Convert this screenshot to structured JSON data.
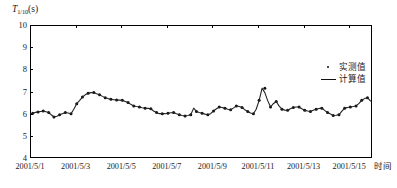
{
  "chart_data": {
    "type": "line",
    "title": "",
    "ylabel": "T1/10(s)",
    "ylabel_base": "T",
    "ylabel_sub": "1/10",
    "ylabel_unit": "(s)",
    "xlabel": "时间",
    "ylim": [
      4,
      10
    ],
    "yticks": [
      4,
      5,
      6,
      7,
      8,
      9,
      10
    ],
    "ytick_labels": [
      "4",
      "5",
      "6",
      "7",
      "8",
      "9",
      "10"
    ],
    "xlim": [
      0,
      15
    ],
    "xticks": [
      0,
      2,
      4,
      6,
      8,
      10,
      12,
      14
    ],
    "xtick_labels": [
      "2001/5/1",
      "2001/5/3",
      "2001/5/5",
      "2001/5/7",
      "2001/5/9",
      "2001/5/11",
      "2001/5/13",
      "2001/5/15"
    ],
    "grid": false,
    "legend_position": "top-right",
    "series": [
      {
        "name": "实测值",
        "marker": "dot",
        "color": "#111111",
        "x": [
          0.12,
          0.35,
          0.58,
          0.82,
          1.05,
          1.3,
          1.55,
          1.8,
          2.05,
          2.3,
          2.55,
          2.8,
          3.05,
          3.3,
          3.55,
          3.8,
          4.05,
          4.3,
          4.55,
          4.8,
          5.05,
          5.3,
          5.55,
          5.8,
          6.05,
          6.3,
          6.55,
          6.8,
          7.05,
          7.3,
          7.55,
          7.8,
          8.05,
          8.3,
          8.55,
          8.8,
          9.05,
          9.3,
          9.55,
          9.8,
          10.05,
          10.3,
          10.55,
          10.8,
          11.05,
          11.3,
          11.55,
          11.8,
          12.05,
          12.3,
          12.55,
          12.8,
          13.05,
          13.3,
          13.55,
          13.8,
          14.05,
          14.3,
          14.55,
          14.8
        ],
        "y": [
          6.02,
          6.08,
          6.12,
          6.05,
          5.85,
          5.95,
          6.05,
          6.0,
          6.45,
          6.75,
          6.92,
          6.95,
          6.85,
          6.72,
          6.65,
          6.62,
          6.6,
          6.5,
          6.35,
          6.3,
          6.25,
          6.22,
          6.05,
          6.0,
          6.02,
          6.05,
          5.95,
          5.9,
          5.95,
          6.1,
          6.02,
          5.95,
          6.12,
          6.3,
          6.25,
          6.18,
          6.35,
          6.28,
          6.1,
          6.0,
          6.6,
          7.15,
          6.3,
          6.55,
          6.2,
          6.15,
          6.28,
          6.3,
          6.15,
          6.1,
          6.2,
          6.25,
          6.05,
          5.92,
          5.95,
          6.25,
          6.3,
          6.35,
          6.6,
          6.72
        ]
      },
      {
        "name": "计算值",
        "marker": "line",
        "color": "#222222",
        "x": [
          0.0,
          0.12,
          0.25,
          0.35,
          0.47,
          0.58,
          0.7,
          0.82,
          0.93,
          1.05,
          1.18,
          1.3,
          1.42,
          1.55,
          1.67,
          1.8,
          1.92,
          2.05,
          2.18,
          2.3,
          2.42,
          2.55,
          2.67,
          2.8,
          2.92,
          3.05,
          3.18,
          3.3,
          3.42,
          3.55,
          3.67,
          3.8,
          3.92,
          4.05,
          4.18,
          4.3,
          4.42,
          4.55,
          4.67,
          4.8,
          4.92,
          5.05,
          5.18,
          5.3,
          5.42,
          5.55,
          5.67,
          5.8,
          5.92,
          6.05,
          6.18,
          6.3,
          6.42,
          6.55,
          6.67,
          6.8,
          6.92,
          7.05,
          7.18,
          7.3,
          7.42,
          7.55,
          7.67,
          7.8,
          7.92,
          8.05,
          8.18,
          8.3,
          8.42,
          8.55,
          8.67,
          8.8,
          8.92,
          9.05,
          9.18,
          9.3,
          9.42,
          9.55,
          9.67,
          9.8,
          9.92,
          10.05,
          10.18,
          10.3,
          10.42,
          10.55,
          10.67,
          10.8,
          10.92,
          11.05,
          11.18,
          11.3,
          11.42,
          11.55,
          11.67,
          11.8,
          11.92,
          12.05,
          12.18,
          12.3,
          12.42,
          12.55,
          12.67,
          12.8,
          12.92,
          13.05,
          13.18,
          13.3,
          13.42,
          13.55,
          13.67,
          13.8,
          13.92,
          14.05,
          14.18,
          14.3,
          14.42,
          14.55,
          14.67,
          14.8,
          14.95
        ],
        "y": [
          5.98,
          6.02,
          6.06,
          6.08,
          6.1,
          6.12,
          6.09,
          6.05,
          5.95,
          5.85,
          5.88,
          5.95,
          6.0,
          6.05,
          6.03,
          6.0,
          6.2,
          6.45,
          6.6,
          6.75,
          6.85,
          6.92,
          6.95,
          6.95,
          6.9,
          6.85,
          6.78,
          6.72,
          6.68,
          6.65,
          6.63,
          6.62,
          6.61,
          6.6,
          6.55,
          6.5,
          6.42,
          6.35,
          6.32,
          6.3,
          6.27,
          6.25,
          6.24,
          6.22,
          6.12,
          6.05,
          6.0,
          6.0,
          6.0,
          6.02,
          6.04,
          6.05,
          6.0,
          5.95,
          5.92,
          5.9,
          5.92,
          5.95,
          6.25,
          6.1,
          6.05,
          6.02,
          5.98,
          5.95,
          6.0,
          6.12,
          6.22,
          6.3,
          6.28,
          6.25,
          6.2,
          6.18,
          6.25,
          6.35,
          6.32,
          6.28,
          6.18,
          6.1,
          6.03,
          6.0,
          6.2,
          6.6,
          7.15,
          6.95,
          6.6,
          6.3,
          6.45,
          6.55,
          6.35,
          6.2,
          6.16,
          6.15,
          6.22,
          6.28,
          6.3,
          6.3,
          6.22,
          6.15,
          6.12,
          6.1,
          6.15,
          6.2,
          6.23,
          6.25,
          6.15,
          6.05,
          5.98,
          5.92,
          5.93,
          5.95,
          6.1,
          6.25,
          6.28,
          6.3,
          6.32,
          6.35,
          6.45,
          6.6,
          6.68,
          6.72,
          6.55
        ]
      }
    ]
  }
}
